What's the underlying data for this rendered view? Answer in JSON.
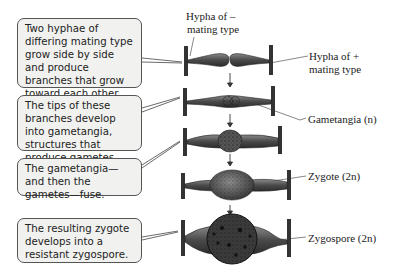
{
  "callouts": [
    {
      "text": "Two hyphae of differing mating type grow side by side and produce branches that grow toward each other."
    },
    {
      "text": "The tips of these branches develop into gametangia, structures that produce gametes."
    },
    {
      "text": "The gametangia—and then the gametes—fuse."
    },
    {
      "text": "The resulting zygote develops into a resistant zygospore."
    }
  ],
  "labels": {
    "hypha_minus_line1": "Hypha of –",
    "hypha_minus_line2": "mating type",
    "hypha_plus_line1": "Hypha of +",
    "hypha_plus_line2": "mating type",
    "gametangia": "Gametangia (n)",
    "zygote": "Zygote (2n)",
    "zygospore": "Zygospore (2n)"
  },
  "colors": {
    "callout_bg": "#f1f1ef",
    "callout_border": "#555555",
    "structure_fill": "#5a5a5a",
    "structure_dark": "#2e2e2e"
  }
}
